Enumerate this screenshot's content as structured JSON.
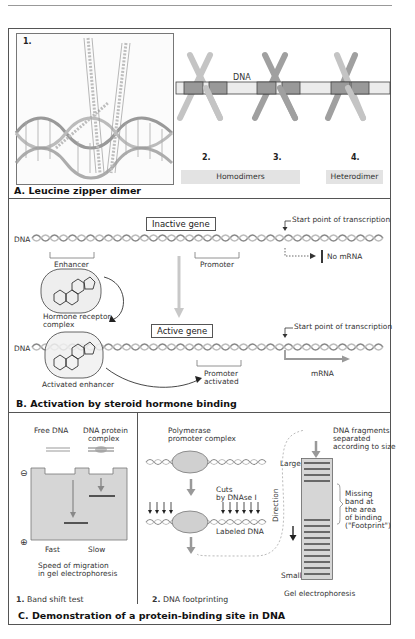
{
  "sections": {
    "A": {
      "title": "A. Leucine zipper dimer",
      "panel_number": "1.",
      "dna_label": "DNA",
      "dimer_numbers": [
        "2.",
        "3.",
        "4."
      ],
      "group_labels": {
        "homodimers": "Homodimers",
        "heterodimer": "Heterodimer"
      }
    },
    "B": {
      "title": "B. Activation by steroid hormone binding",
      "inactive_gene": "Inactive gene",
      "active_gene": "Active gene",
      "dna_label_top": "DNA",
      "dna_label_bottom": "DNA",
      "start_point_top": "Start point of transcription",
      "start_point_bottom": "Start point of transcription",
      "enhancer": "Enhancer",
      "promoter": "Promoter",
      "no_mrna": "No mRNA",
      "hormone_receptor_complex_line1": "Hormone receptor",
      "hormone_receptor_complex_line2": "complex",
      "activated_enhancer": "Activated enhancer",
      "promoter_activated_line1": "Promoter",
      "promoter_activated_line2": "activated",
      "mrna": "mRNA"
    },
    "C": {
      "title": "C. Demonstration of a protein-binding site in DNA",
      "panel1": {
        "number": "1.",
        "caption": "Band shift test",
        "free_dna": "Free DNA",
        "complex_line1": "DNA protein",
        "complex_line2": "complex",
        "minus": "⊖",
        "plus": "⊕",
        "fast": "Fast",
        "slow": "Slow",
        "speed_line1": "Speed of migration",
        "speed_line2": "in gel electrophoresis"
      },
      "panel2": {
        "number": "2.",
        "caption": "DNA footprinting",
        "polymerase_line1": "Polymerase",
        "polymerase_line2": "promoter complex",
        "cuts_line1": "Cuts",
        "cuts_line2": "by DNAse I",
        "labeled_dna": "Labeled DNA",
        "fragments_line1": "DNA fragments",
        "fragments_line2": "separated",
        "fragments_line3": "according to size",
        "large": "Large",
        "small": "Small",
        "direction": "Direction",
        "missing_line1": "Missing",
        "missing_line2": "band at",
        "missing_line3": "the area",
        "missing_line4": "of binding",
        "missing_line5": "(\"Footprint\")",
        "gel_label": "Gel electrophoresis"
      }
    }
  },
  "colors": {
    "frame": "#555555",
    "gel_fill": "#d6d6d6",
    "band": "#444444",
    "helix_light": "#c8c8c8",
    "helix_dark": "#8a8a8a",
    "pill_bg": "#e3e3e3",
    "arrow_gray": "#a8a8a8"
  }
}
